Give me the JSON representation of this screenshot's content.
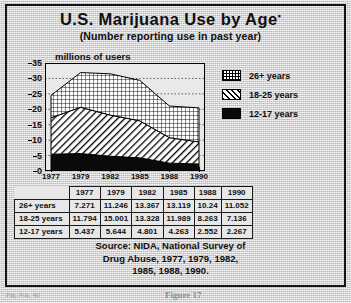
{
  "title": "U.S. Marijuana Use by Age",
  "title_footnote_marker": "▪",
  "subtitle": "(Number reporting use in past year)",
  "y_axis_label": "millions of users",
  "legend": {
    "items": [
      {
        "label": "26+ years",
        "pattern": "crosshatch-icon"
      },
      {
        "label": "18-25 years",
        "pattern": "diagonal-stripe-icon"
      },
      {
        "label": "12-17 years",
        "pattern": "solid-black-icon"
      }
    ]
  },
  "table": {
    "column_headers": [
      "1977",
      "1979",
      "1982",
      "1985",
      "1988",
      "1990"
    ],
    "rows": [
      {
        "label": "26+ years",
        "values": [
          "7.271",
          "11.246",
          "13.367",
          "13.119",
          "10.24",
          "11.052"
        ]
      },
      {
        "label": "18-25 years",
        "values": [
          "11.794",
          "15.001",
          "13.328",
          "11.989",
          "8.263",
          "7.136"
        ]
      },
      {
        "label": "12-17 years",
        "values": [
          "5.437",
          "5.644",
          "4.801",
          "4.263",
          "2.552",
          "2.267"
        ]
      }
    ]
  },
  "source": {
    "line1": "Source: NIDA, National Survey of",
    "line2": "Drug Abuse, 1977, 1979, 1982,",
    "line3": "1985, 1988, 1990."
  },
  "captions": {
    "left": "Fig. Nat. 40",
    "right": "Figure 17"
  },
  "chart_data": {
    "type": "area",
    "stacked": true,
    "title": "U.S. Marijuana Use by Age",
    "subtitle": "(Number reporting use in past year)",
    "xlabel": "",
    "ylabel": "millions of users",
    "x": [
      "1977",
      "1979",
      "1982",
      "1985",
      "1988",
      "1990"
    ],
    "ylim": [
      0,
      35
    ],
    "yticks": [
      0,
      5,
      10,
      15,
      20,
      25,
      30,
      35
    ],
    "grid": "horizontal-dotted",
    "legend_position": "right",
    "stack_order_bottom_to_top": [
      "12-17 years",
      "18-25 years",
      "26+ years"
    ],
    "series": [
      {
        "name": "12-17 years",
        "values": [
          5.437,
          5.644,
          4.801,
          4.263,
          2.552,
          2.267
        ],
        "pattern": "solid-black"
      },
      {
        "name": "18-25 years",
        "values": [
          11.794,
          15.001,
          13.328,
          11.989,
          8.263,
          7.136
        ],
        "pattern": "diagonal-stripe"
      },
      {
        "name": "26+ years",
        "values": [
          7.271,
          11.246,
          13.367,
          13.119,
          10.24,
          11.052
        ],
        "pattern": "crosshatch"
      }
    ],
    "totals": [
      24.502,
      31.891,
      31.496,
      29.371,
      21.055,
      20.455
    ]
  }
}
